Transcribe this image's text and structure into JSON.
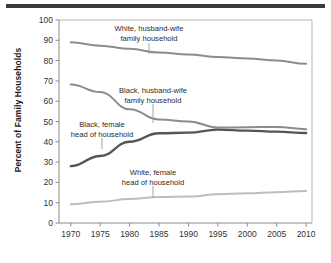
{
  "figure": {
    "y_axis_title": "Percent of Family Households",
    "top_rule": true
  },
  "chart_data": {
    "type": "line",
    "title": "",
    "xlabel": "",
    "ylabel": "Percent of Family Households",
    "xlim": [
      1968,
      2011
    ],
    "ylim": [
      0,
      100
    ],
    "grid": false,
    "legend_position": "inline-annotations",
    "xticks": [
      1970,
      1975,
      1980,
      1985,
      1990,
      1995,
      2000,
      2005,
      2010
    ],
    "yticks": [
      0,
      10,
      20,
      30,
      40,
      50,
      60,
      70,
      80,
      90,
      100
    ],
    "x": [
      1970,
      1975,
      1980,
      1985,
      1990,
      1995,
      2000,
      2005,
      2010
    ],
    "series": [
      {
        "name": "White, husband-wife family household",
        "color": "#8c8c8c",
        "values": [
          89.0,
          87.3,
          85.8,
          84.0,
          83.0,
          81.8,
          81.0,
          80.0,
          78.4
        ]
      },
      {
        "name": "Black, husband-wife family household",
        "color": "#8c8c8c",
        "values": [
          68.2,
          64.5,
          56.0,
          51.0,
          50.0,
          47.0,
          47.2,
          47.3,
          46.2
        ]
      },
      {
        "name": "Black, female head of household",
        "color": "#555555",
        "values": [
          28.0,
          33.0,
          40.0,
          44.2,
          44.5,
          46.0,
          45.5,
          45.0,
          44.3
        ]
      },
      {
        "name": "White, female head of household",
        "color": "#bdbdbd",
        "values": [
          9.2,
          10.5,
          11.8,
          12.8,
          13.0,
          14.2,
          14.6,
          15.2,
          15.8
        ]
      }
    ],
    "annotations": [
      {
        "name": "white-husband-wife",
        "line1": "White, husband-wife",
        "line2": "family household",
        "text_x": 149,
        "text_y": 31,
        "leader_x": 149,
        "leader_y1": 43,
        "leader_y2": 54
      },
      {
        "name": "black-husband-wife",
        "line1": "Black, husband-wife",
        "line2": "family household",
        "text_x": 153,
        "text_y": 93,
        "leader_x": 153,
        "leader_y1": 104,
        "leader_y2": 123
      },
      {
        "name": "black-female",
        "line1": "Black, female",
        "line2": "head of household",
        "text_x": 102,
        "text_y": 127,
        "leader_x": 102,
        "leader_y1": 138,
        "leader_y2": 149
      },
      {
        "name": "white-female",
        "line1": "White, female",
        "line2": "head of household",
        "text_x": 153,
        "text_y": 175,
        "leader_x": 153,
        "leader_y1": 186,
        "leader_y2": 198
      }
    ]
  }
}
